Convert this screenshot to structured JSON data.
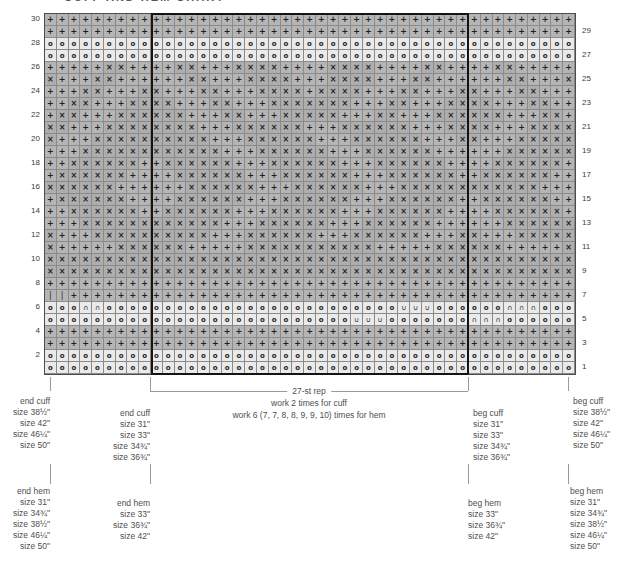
{
  "title": "CUFF AND HEM CHART",
  "colors": {
    "cell_gray": "#b5b5b5",
    "cell_gray_dark": "#aeaeae",
    "cell_light": "#eaeaea",
    "grid_line": "#8a8a8a",
    "outer_border": "#4d4d4d",
    "repeat_border": "#141414",
    "symbol": "#1f1f1f",
    "label_text": "#4f4f4f",
    "tick": "#9a9a9a"
  },
  "chart_data": {
    "type": "heatmap",
    "kind": "knitting-colorwork-chart",
    "columns": 45,
    "rows": 30,
    "repeat": {
      "stitches": 27,
      "start_col": 10,
      "end_col": 36,
      "label": "27-st rep"
    },
    "symbols": {
      "+": "plus",
      "x": "x-cross",
      "o": "circle",
      "u": "cup",
      "n": "cap",
      "|": "bar"
    },
    "left_row_numbers": [
      30,
      28,
      26,
      24,
      22,
      20,
      18,
      16,
      14,
      12,
      10,
      8,
      6,
      4,
      2
    ],
    "right_row_numbers": [
      29,
      27,
      25,
      23,
      21,
      19,
      17,
      15,
      13,
      11,
      9,
      7,
      5,
      3,
      1
    ],
    "rows_top_to_bottom": [
      {
        "row": 30,
        "cells": "+++++++++++++++++++++++++++++++++++++++++++++"
      },
      {
        "row": 29,
        "cells": "+++++++++++++++++++++++++++++++++++++++++++++"
      },
      {
        "row": 28,
        "cells": "ooooooooooooooooooooooooooooooooooooooooooooo"
      },
      {
        "row": 27,
        "cells": "ooooooooooooooooooooooooooooooooooooooooooooo"
      },
      {
        "row": 26,
        "cells": "+++++xx++++xx+++xxxx++++xxxx++++xx++++xx+++++"
      },
      {
        "row": 25,
        "cells": "x+++xx++++++xx+++xxxx+++xxxx+++xx++++++xx+++x"
      },
      {
        "row": 24,
        "cells": "+++xx+++xx+++xx+++xxxx+xxxx+++xx+++xx+++xx+++"
      },
      {
        "row": 23,
        "cells": "++xx+++xxxx+++xx+++xxxxxxx+++xx+++xxxx+++xx++"
      },
      {
        "row": 22,
        "cells": "+xx+++xxxxxx+++xx+++xxxxx+++xx+++xxxxxx+++xx+"
      },
      {
        "row": 21,
        "cells": "xx+++xxxxxxxx+++xxxxxx+++xxxxxx+++xxxx+++xxxx"
      },
      {
        "row": 20,
        "cells": "x+++xxxxxxxxxx+++xxxxxx+++xxxxxx+++xx+++xxxxx"
      },
      {
        "row": 19,
        "cells": "+++xxxxxxxxxxxx+++xxxxxx+++xxxxxx++++++xxxxxx"
      },
      {
        "row": 18,
        "cells": "++xxxxxx++xxxxxx+++xxxxxx+++xxxxxx++++xxxxxx+"
      },
      {
        "row": 17,
        "cells": "+xxxxxx++++xxxxxx+++xxxxxx+++xxxxxx++xxxxxx++"
      },
      {
        "row": 16,
        "cells": "xxxxxx++++++xxxxxx+++xxxxxx+++xxxxxxxxxxxx+++"
      },
      {
        "row": 15,
        "cells": "+xxxxxx++++xxxxxx+++xxxxxx+++xxxxxx++xxxxxx++"
      },
      {
        "row": 14,
        "cells": "++xxxxxx++xxxxxx+++xxxxxx+++xxxxxx++++xxxxxx+"
      },
      {
        "row": 13,
        "cells": "+++xxxxxxxxxxxx+++xxxxxx+++xxxxxx++++++xxxxxx"
      },
      {
        "row": 12,
        "cells": "x+++xxxxxxxxxx+++xxxxxx+++xxxxxx+++xx+++xxxxx"
      },
      {
        "row": 11,
        "cells": "x+++++xxxxxx+++++xxxxxxxxxxx+++++xxxxxx+++++x"
      },
      {
        "row": 10,
        "cells": "xxxxxxxxxxxxxxxxxxxxxxxxxxxxxxxxxxxxxxxxxxxxx"
      },
      {
        "row": 9,
        "cells": "xxxxxxxxxxxxxxxxxxxxxxxxxxxxxxxxxxxxxxxxxxxxx"
      },
      {
        "row": 8,
        "cells": "+++++++++++++++++++++++++++++++++++++++++++++"
      },
      {
        "row": 7,
        "cells": "||+++++++++++++++++++++++++++++++++++++++++++"
      },
      {
        "row": 6,
        "cells": "ooonnooooooooooooooooooooooooouuuoooooonnnoooo"
      },
      {
        "row": 5,
        "cells": "oooooooooooooooooooooooooouuuooooooonnnoooooo"
      },
      {
        "row": 4,
        "cells": "+++++++++++++++++++++++++++++++++++++++++++++"
      },
      {
        "row": 3,
        "cells": "+++++++++++++++++++++++++++++++++++++++++++++"
      },
      {
        "row": 2,
        "cells": "ooooooooooooooooooooooooooooooooooooooooooooo"
      },
      {
        "row": 1,
        "cells": "ooooooooooooooooooooooooooooooooooooooooooooo"
      }
    ]
  },
  "annotations": {
    "center": {
      "line1": "27-st rep",
      "line2": "work 2 times for cuff",
      "line3": "work 6 (7, 7, 8, 8, 9, 9, 10) times for hem",
      "cx": 309,
      "y1": 386,
      "y2": 398,
      "y3": 410
    },
    "bracket": {
      "x1": 150,
      "x2": 468,
      "y": 391
    },
    "ticks": {
      "xs": [
        50,
        150,
        468,
        568
      ],
      "cuff_y": 377,
      "cuff_h": 14,
      "hem_y": 464,
      "hem_h": 20
    },
    "blocks": [
      {
        "id": "end-cuff-outer",
        "align": "right",
        "x": 50,
        "top": 396,
        "lines": [
          "end cuff",
          "size 38½\"",
          "size 42\"",
          "size 46¼\"",
          "size 50\""
        ]
      },
      {
        "id": "end-cuff-inner",
        "align": "right",
        "x": 150,
        "top": 408,
        "lines": [
          "end cuff",
          "size 31\"",
          "size 33\"",
          "size 34¾\"",
          "size 36¾\""
        ]
      },
      {
        "id": "beg-cuff-inner",
        "align": "left",
        "x": 473,
        "top": 408,
        "lines": [
          "beg cuff",
          "size 31\"",
          "size 33\"",
          "size 34¾\"",
          "size 36¾\""
        ]
      },
      {
        "id": "beg-cuff-outer",
        "align": "left",
        "x": 573,
        "top": 396,
        "lines": [
          "beg cuff",
          "size 38½\"",
          "size 42\"",
          "size 46¼\"",
          "size 50\""
        ]
      },
      {
        "id": "end-hem-outer",
        "align": "right",
        "x": 50,
        "top": 486,
        "lines": [
          "end hem",
          "size 31\"",
          "size 34¾\"",
          "size 38½\"",
          "size 46¼\"",
          "size 50\""
        ]
      },
      {
        "id": "end-hem-inner",
        "align": "right",
        "x": 150,
        "top": 498,
        "lines": [
          "end hem",
          "size 33\"",
          "size 36¾\"",
          "size 42\""
        ]
      },
      {
        "id": "beg-hem-inner",
        "align": "left",
        "x": 468,
        "top": 498,
        "lines": [
          "beg hem",
          "size 33\"",
          "size 36¾\"",
          "size 42\""
        ]
      },
      {
        "id": "beg-hem-outer",
        "align": "left",
        "x": 570,
        "top": 486,
        "lines": [
          "beg hem",
          "size 31\"",
          "size 34¾\"",
          "size 38½\"",
          "size 46¼\"",
          "size 50\""
        ]
      }
    ]
  }
}
